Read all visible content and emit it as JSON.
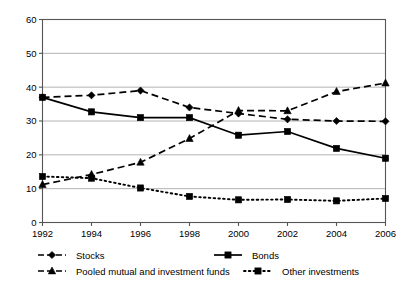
{
  "chart_data": {
    "type": "line",
    "title": "",
    "subtitle": "",
    "xlabel": "",
    "ylabel": "",
    "categories": [
      "1992",
      "1994",
      "1996",
      "1998",
      "2000",
      "2002",
      "2004",
      "2006"
    ],
    "x": [
      1992,
      1994,
      1996,
      1998,
      2000,
      2002,
      2004,
      2006
    ],
    "xlim": [
      1992,
      2006
    ],
    "ylim": [
      0,
      60
    ],
    "yticks": [
      0,
      10,
      20,
      30,
      40,
      50,
      60
    ],
    "ytick_labels": [
      "0",
      "10",
      "20",
      "30",
      "40",
      "50",
      "60"
    ],
    "grid": "horizontal",
    "legend_position": "bottom",
    "series": [
      {
        "name": "Stocks",
        "marker": "diamond",
        "line_style": "dashed",
        "color": "#000000",
        "values": [
          37.0,
          37.6,
          39.0,
          34.0,
          32.2,
          30.5,
          30.0,
          29.9
        ]
      },
      {
        "name": "Bonds",
        "marker": "square",
        "line_style": "solid",
        "color": "#000000",
        "values": [
          37.0,
          32.7,
          31.0,
          31.0,
          25.8,
          26.9,
          21.9,
          19.0
        ]
      },
      {
        "name": "Pooled mutual and investment funds",
        "marker": "triangle",
        "line_style": "dashed",
        "color": "#000000",
        "values": [
          11.2,
          14.2,
          17.8,
          24.8,
          33.1,
          33.0,
          38.7,
          41.2
        ]
      },
      {
        "name": "Other investments",
        "marker": "square",
        "line_style": "dotted",
        "color": "#000000",
        "values": [
          13.6,
          13.1,
          10.2,
          7.7,
          6.7,
          6.8,
          6.4,
          7.1
        ]
      }
    ]
  },
  "legend": {
    "items": [
      {
        "label": "Stocks",
        "marker": "diamond",
        "line_style": "dashed"
      },
      {
        "label": "Bonds",
        "marker": "square",
        "line_style": "solid"
      },
      {
        "label": "Pooled mutual and investment funds",
        "marker": "triangle",
        "line_style": "dashed"
      },
      {
        "label": "Other investments",
        "marker": "square",
        "line_style": "dotted"
      }
    ]
  }
}
